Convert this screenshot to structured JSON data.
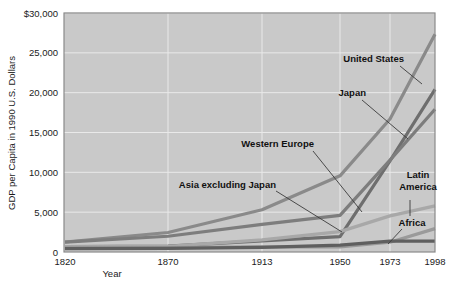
{
  "chart_data": {
    "type": "line",
    "title": "",
    "xlabel": "Year",
    "ylabel": "GDP per Capita in 1990 U.S. Dollars",
    "categories": [
      "1820",
      "1870",
      "1913",
      "1950",
      "1973",
      "1998"
    ],
    "x_tick_labels": [
      "1820",
      "1870",
      "1913",
      "1950",
      "1973",
      "1998"
    ],
    "y_tick_labels": [
      "0",
      "5,000",
      "10,000",
      "15,000",
      "20,000",
      "25,000",
      "$30,000"
    ],
    "y_tick_values": [
      0,
      5000,
      10000,
      15000,
      20000,
      25000,
      30000
    ],
    "ylim": [
      0,
      30000
    ],
    "grid": true,
    "legend_position": "inline-annotations",
    "series": [
      {
        "name": "United States",
        "color": "#8a8a8a",
        "values": [
          1257,
          2445,
          5301,
          9561,
          16689,
          27331
        ]
      },
      {
        "name": "Japan",
        "color": "#6e6e6e",
        "values": [
          669,
          737,
          1387,
          1926,
          11439,
          20413
        ]
      },
      {
        "name": "Western Europe",
        "color": "#7d7d7d",
        "values": [
          1232,
          1974,
          3473,
          4594,
          11534,
          17921
        ]
      },
      {
        "name": "Latin America",
        "color": "#a8a8a8",
        "values": [
          665,
          698,
          1511,
          2554,
          4531,
          5795
        ]
      },
      {
        "name": "Asia excluding Japan",
        "color": "#9a9a9a",
        "values": [
          575,
          543,
          640,
          635,
          1231,
          2936
        ]
      },
      {
        "name": "Africa",
        "color": "#5f5f5f",
        "values": [
          418,
          444,
          585,
          852,
          1365,
          1368
        ]
      }
    ],
    "annotations": [
      {
        "label": "United States",
        "x": 404,
        "y": 62,
        "anchor": "end",
        "leader": [
          [
            400,
            66
          ],
          [
            422,
            84
          ]
        ]
      },
      {
        "label": "Japan",
        "x": 366,
        "y": 96,
        "anchor": "end",
        "leader": [
          [
            362,
            100
          ],
          [
            408,
            139
          ]
        ]
      },
      {
        "label": "Western Europe",
        "x": 314,
        "y": 147,
        "anchor": "end",
        "leader": [
          [
            313,
            151
          ],
          [
            362,
            212
          ]
        ]
      },
      {
        "label": "Asia excluding Japan",
        "x": 276,
        "y": 188,
        "anchor": "end",
        "leader": [
          [
            276,
            191
          ],
          [
            342,
            232
          ]
        ]
      },
      {
        "label": "Latin America",
        "x": 418,
        "y": 178,
        "anchor": "middle",
        "leader": [
          [
            410,
            200
          ],
          [
            410,
            216
          ]
        ]
      },
      {
        "label": "Africa",
        "x": 412,
        "y": 226,
        "anchor": "middle",
        "leader": [
          [
            402,
            229
          ],
          [
            388,
            244
          ]
        ]
      }
    ]
  }
}
